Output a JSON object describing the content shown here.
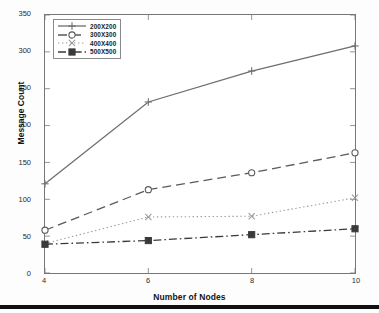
{
  "chart_data": {
    "type": "line",
    "title": "",
    "xlabel": "Number of Nodes",
    "ylabel": "Message Count",
    "x": [
      4,
      6,
      8,
      10
    ],
    "xticks": [
      "4",
      "6",
      "8",
      "10"
    ],
    "yticks": [
      "0",
      "50",
      "100",
      "150",
      "200",
      "250",
      "300",
      "350"
    ],
    "xlim": [
      4,
      10
    ],
    "ylim": [
      0,
      350
    ],
    "grid": false,
    "legend_position": "top-left",
    "series": [
      {
        "name": "200X200",
        "values": [
          121,
          232,
          274,
          308
        ],
        "line_style": "solid",
        "marker": "plus",
        "color": "#6e6e6e"
      },
      {
        "name": "300X300",
        "values": [
          58,
          113,
          136,
          163
        ],
        "line_style": "dashed",
        "marker": "circle",
        "color": "#5a5a5a"
      },
      {
        "name": "400X400",
        "values": [
          40,
          76,
          77,
          102
        ],
        "line_style": "dotted",
        "marker": "x",
        "color": "#9b9b9b"
      },
      {
        "name": "500X500",
        "values": [
          39,
          44,
          52,
          60
        ],
        "line_style": "dash-dot",
        "marker": "square",
        "color": "#3a3a3a"
      }
    ]
  }
}
